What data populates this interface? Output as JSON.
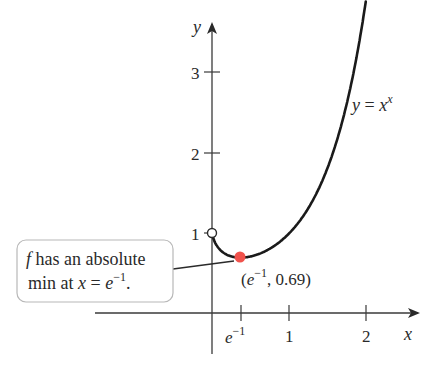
{
  "chart_data": {
    "type": "line",
    "title": "",
    "function": "y = x^x",
    "xlabel": "x",
    "ylabel": "y",
    "x_ticks": [
      {
        "value": 0.3679,
        "label": "e^-1"
      },
      {
        "value": 1,
        "label": "1"
      },
      {
        "value": 2,
        "label": "2"
      }
    ],
    "y_ticks": [
      {
        "value": 1,
        "label": "1"
      },
      {
        "value": 2,
        "label": "2"
      },
      {
        "value": 3,
        "label": "3"
      }
    ],
    "xlim": [
      -1.5,
      2.7
    ],
    "ylim": [
      -0.5,
      3.6
    ],
    "grid": false,
    "series": [
      {
        "name": "y = x^x",
        "x": [
          0.0,
          0.05,
          0.1,
          0.2,
          0.3,
          0.3679,
          0.5,
          0.7,
          1.0,
          1.3,
          1.5,
          1.7,
          1.9,
          1.98
        ],
        "y": [
          1.0,
          0.861,
          0.794,
          0.725,
          0.697,
          0.692,
          0.707,
          0.779,
          1.0,
          1.406,
          1.837,
          2.465,
          3.387,
          3.86
        ]
      }
    ],
    "points": [
      {
        "x": 0,
        "y": 1,
        "style": "open-circle"
      },
      {
        "x": 0.3679,
        "y": 0.69,
        "style": "filled",
        "color": "#f0524c",
        "label": "(e^-1, 0.69)"
      }
    ],
    "annotations": [
      {
        "text": "f has an absolute min at x = e^-1.",
        "target": "minimum point"
      },
      {
        "text": "y = x^x",
        "target": "curve"
      }
    ]
  },
  "labels": {
    "y_axis": "y",
    "x_axis": "x",
    "y_tick_3": "3",
    "y_tick_2": "2",
    "y_tick_1": "1",
    "x_tick_e_base": "e",
    "x_tick_e_exp": "−1",
    "x_tick_1": "1",
    "x_tick_2": "2",
    "curve_label_y": "y",
    "curve_label_eq": " = ",
    "curve_label_x": "x",
    "curve_label_exp": "x",
    "point_open": "(",
    "point_e": "e",
    "point_exp": "−1",
    "point_rest": ", 0.69)",
    "callout_f": "f",
    "callout_line1": " has an absolute",
    "callout_line2_a": "min at ",
    "callout_line2_x": "x",
    "callout_line2_eq": " = ",
    "callout_line2_e": "e",
    "callout_line2_exp": "−1",
    "callout_line2_dot": "."
  },
  "colors": {
    "curve": "#1a1a1a",
    "axis": "#3a3a3a",
    "min_point": "#f0524c",
    "callout_border": "#b8b8b8"
  }
}
